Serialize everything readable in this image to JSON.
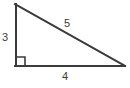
{
  "diagram": {
    "type": "right-triangle",
    "background_color": "#ffffff",
    "stroke_color": "#3b3b3b",
    "label_color": "#3b3b3b",
    "stroke_width": 2,
    "vertices": {
      "top": {
        "x": 15,
        "y": 4
      },
      "bottom_left": {
        "x": 15,
        "y": 66
      },
      "bottom_right": {
        "x": 125,
        "y": 66
      }
    },
    "right_angle_marker": {
      "x": 15,
      "y": 56,
      "size": 10,
      "at_vertex": "bottom_left"
    },
    "labels": {
      "vertical_leg": "3",
      "horizontal_leg": "4",
      "hypotenuse": "5"
    }
  }
}
